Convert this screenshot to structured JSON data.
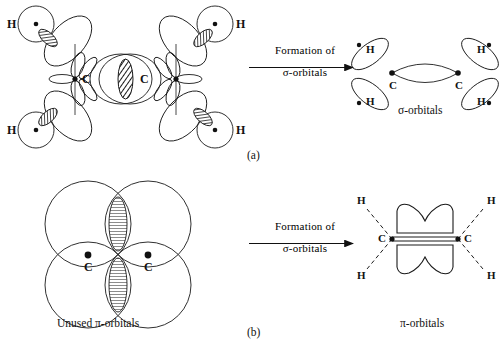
{
  "figure": {
    "panels": [
      {
        "id": "a",
        "caption": "(a)",
        "left_diagram": {
          "name": "atomic-orbital-overlap-diagram",
          "carbon_labels": [
            "C",
            "C"
          ],
          "hydrogen_labels": [
            "H",
            "H",
            "H",
            "H"
          ],
          "description": "Four hydrogen s-orbitals overlapping with two carbon sp2 hybrid orbital sets, with unused p-orbital lobes at each carbon"
        },
        "arrow": {
          "top_text": "Formation of",
          "bottom_text": "σ-orbitals"
        },
        "right_diagram": {
          "name": "sigma-orbital-diagram",
          "carbon_labels": [
            "C",
            "C"
          ],
          "hydrogen_labels": [
            "H",
            "H",
            "H",
            "H"
          ],
          "caption": "σ-orbitals"
        }
      },
      {
        "id": "b",
        "caption": "(b)",
        "left_diagram": {
          "name": "unused-pi-orbital-diagram",
          "carbon_labels": [
            "C",
            "C"
          ],
          "caption": "Unused π-orbitals",
          "description": "Four large circular p-orbital lobes, two above and two below, with hatched overlap lenses"
        },
        "arrow": {
          "top_text": "Formation of",
          "bottom_text": "σ-orbitals"
        },
        "right_diagram": {
          "name": "pi-orbital-diagram",
          "carbon_labels": [
            "C",
            "C"
          ],
          "hydrogen_labels": [
            "H",
            "H",
            "H",
            "H"
          ],
          "caption": "π-orbitals"
        }
      }
    ],
    "colors": {
      "stroke": "#1a1a1a",
      "background": "#ffffff",
      "hatch": "#2b2b2b"
    }
  }
}
